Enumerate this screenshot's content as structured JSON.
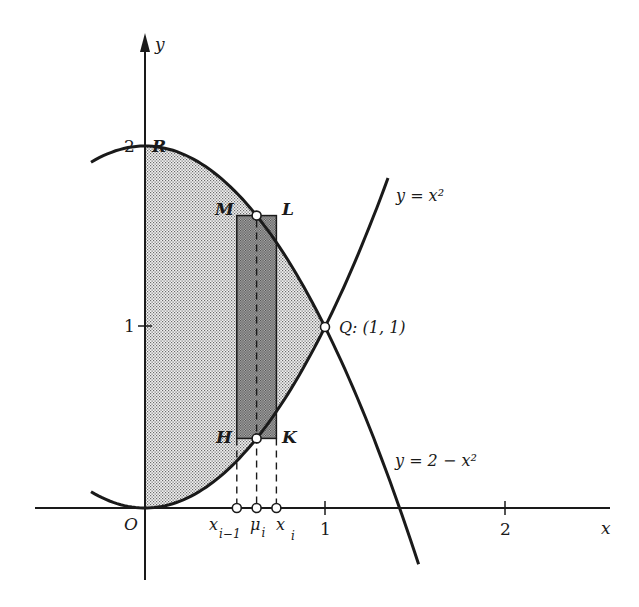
{
  "diagram": {
    "axes": {
      "x_label": "x",
      "y_label": "y",
      "origin_label": "O",
      "x_ticks": [
        "1",
        "2"
      ],
      "y_ticks": [
        "1",
        "2"
      ]
    },
    "curves": [
      {
        "id": "upper",
        "label": "y = 2 − x²",
        "equation": "y = 2 - x^2"
      },
      {
        "id": "lower",
        "label": "y = x²",
        "equation": "y = x^2"
      }
    ],
    "points": {
      "R": "R",
      "M": "M",
      "L": "L",
      "H": "H",
      "K": "K",
      "Q": "Q: (1, 1)"
    },
    "x_markers": {
      "x_prev": {
        "base": "x",
        "sub": "i−1"
      },
      "mu": {
        "base": "μ",
        "sub": "i"
      },
      "x_cur": {
        "base": "x",
        "sub": "i"
      }
    },
    "shading": {
      "region_fill": "#d9d9d9",
      "rect_fill": "#a8a8a8",
      "stroke": "#1a1a1a"
    },
    "coordinate_mapping": {
      "origin_px": [
        145,
        508
      ],
      "px_per_unit_x": 180,
      "px_per_unit_y": 181
    },
    "rectangle": {
      "x_left": 0.51,
      "x_right": 0.73,
      "mu": 0.62
    }
  }
}
